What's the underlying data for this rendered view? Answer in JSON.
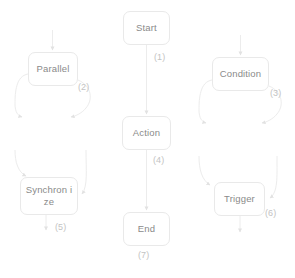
{
  "diagram": {
    "type": "flowchart",
    "background_color": "#ffffff",
    "node_fill_color": "#ffffff",
    "node_border_color": "#e9e9e9",
    "node_text_color": "#8a8a8a",
    "edge_line_color": "#ececec",
    "edge_label_color": "#c3c3c3",
    "nodes": [
      {
        "id": "start",
        "label": "Start",
        "x": 123,
        "y": 11,
        "w": 47,
        "h": 34
      },
      {
        "id": "parallel",
        "label": "Parallel",
        "x": 28,
        "y": 52,
        "w": 50,
        "h": 34
      },
      {
        "id": "condition",
        "label": "Condition",
        "x": 212,
        "y": 57,
        "w": 57,
        "h": 34
      },
      {
        "id": "action",
        "label": "Action",
        "x": 122,
        "y": 116,
        "w": 49,
        "h": 34
      },
      {
        "id": "synchronize",
        "label": "Synchron ize",
        "x": 20,
        "y": 177,
        "w": 58,
        "h": 38
      },
      {
        "id": "trigger",
        "label": "Trigger",
        "x": 214,
        "y": 182,
        "w": 51,
        "h": 34
      },
      {
        "id": "end",
        "label": "End",
        "x": 123,
        "y": 212,
        "w": 47,
        "h": 34
      }
    ],
    "edge_labels": [
      {
        "id": "edge-1",
        "text": "(1)",
        "x": 154,
        "y": 52
      },
      {
        "id": "edge-2",
        "text": "(2)",
        "x": 78,
        "y": 82
      },
      {
        "id": "edge-3",
        "text": "(3)",
        "x": 270,
        "y": 88
      },
      {
        "id": "edge-4",
        "text": "(4)",
        "x": 153,
        "y": 155
      },
      {
        "id": "edge-5",
        "text": "(5)",
        "x": 55,
        "y": 222
      },
      {
        "id": "edge-6",
        "text": "(6)",
        "x": 265,
        "y": 208
      },
      {
        "id": "edge-7",
        "text": "(7)",
        "x": 138,
        "y": 250
      }
    ]
  }
}
